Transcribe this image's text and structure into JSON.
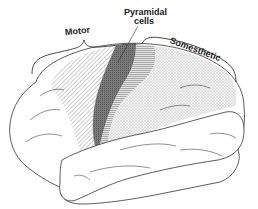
{
  "figure": {
    "type": "lateral view of cerebral cortex",
    "labels": {
      "pyramidal_line1": "Pyramidal",
      "pyramidal_line2": "cells",
      "motor": "Motor",
      "somesthetic": "Somesthetic"
    },
    "regions": [
      {
        "name": "motor-association",
        "pattern": "diagonal-hatch"
      },
      {
        "name": "primary-motor-pyramidal",
        "pattern": "dark-crosshatch"
      },
      {
        "name": "primary-somatosensory",
        "pattern": "horizontal-lines"
      },
      {
        "name": "somesthetic-association",
        "pattern": "stipple"
      }
    ],
    "colors": {
      "outline": "#333333",
      "dark_region": "#6a6a6a",
      "hatch": "#9a9a9a",
      "stipple": "#b5b5b5"
    }
  }
}
